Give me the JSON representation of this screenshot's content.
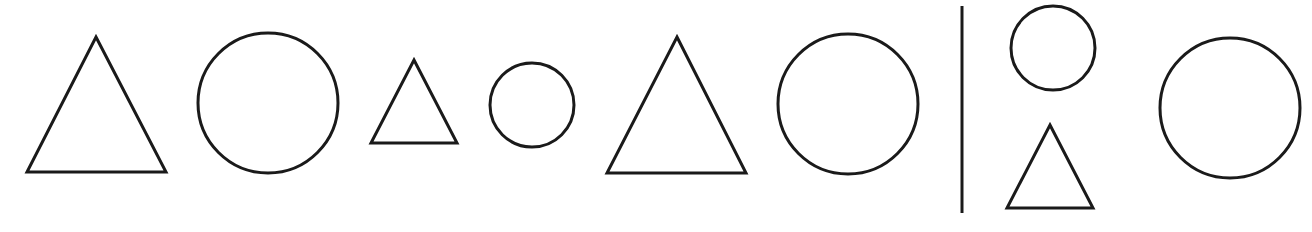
{
  "figure": {
    "background": "#ffffff",
    "stroke_color": "#1a1a1a",
    "sequence_label": "shape pattern sequence",
    "sequence": [
      {
        "type": "triangle",
        "size": "large",
        "apex": [
          96,
          37
        ],
        "base_left": [
          27,
          172
        ],
        "base_right": [
          166,
          172
        ]
      },
      {
        "type": "circle",
        "size": "large",
        "cx": 268,
        "cy": 103,
        "r": 70
      },
      {
        "type": "triangle",
        "size": "small",
        "apex": [
          414,
          60
        ],
        "base_left": [
          371,
          143
        ],
        "base_right": [
          457,
          143
        ]
      },
      {
        "type": "circle",
        "size": "small",
        "cx": 532,
        "cy": 105,
        "r": 42
      },
      {
        "type": "triangle",
        "size": "large",
        "apex": [
          677,
          37
        ],
        "base_left": [
          607,
          173
        ],
        "base_right": [
          746,
          173
        ]
      },
      {
        "type": "circle",
        "size": "large",
        "cx": 848,
        "cy": 104,
        "r": 70
      }
    ],
    "divider": {
      "x": 962,
      "y1": 6,
      "y2": 213
    },
    "options": [
      {
        "id": "option-stack",
        "shapes": [
          {
            "type": "circle",
            "size": "small",
            "cx": 1053,
            "cy": 48,
            "r": 42
          },
          {
            "type": "triangle",
            "size": "small",
            "apex": [
              1050,
              125
            ],
            "base_left": [
              1007,
              208
            ],
            "base_right": [
              1093,
              208
            ]
          }
        ]
      },
      {
        "id": "option-large-circle",
        "shapes": [
          {
            "type": "circle",
            "size": "large",
            "cx": 1230,
            "cy": 108,
            "r": 70
          }
        ]
      }
    ]
  }
}
